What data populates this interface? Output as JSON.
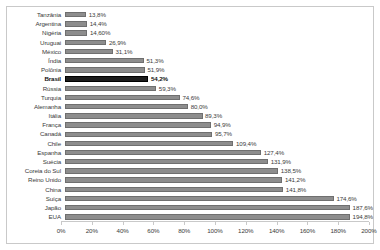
{
  "chart_data": {
    "type": "bar",
    "orientation": "horizontal",
    "title": "",
    "xlabel": "",
    "ylabel": "",
    "xlim": [
      0,
      200
    ],
    "grid": false,
    "legend": null,
    "highlight_category": "Brasil",
    "colors": {
      "bar": "#8d8d8d",
      "bar_highlight": "#1c1c1c",
      "border": "#c9c9c9",
      "text": "#3b3b3b"
    },
    "value_suffix": "%",
    "decimal_separator": ",",
    "xticks": [
      "0%",
      "20%",
      "40%",
      "60%",
      "80%",
      "100%",
      "120%",
      "140%",
      "160%",
      "180%",
      "200%"
    ],
    "xtick_values": [
      0,
      20,
      40,
      60,
      80,
      100,
      120,
      140,
      160,
      180,
      200
    ],
    "categories": [
      "Tanzânia",
      "Argentina",
      "Nigéria",
      "Uruguai",
      "México",
      "Índia",
      "Polônia",
      "Brasil",
      "Rússia",
      "Turquia",
      "Alemanha",
      "Itália",
      "França",
      "Canadá",
      "Chile",
      "Espanha",
      "Suécia",
      "Coreia do Sul",
      "Reino Unido",
      "China",
      "Suíça",
      "Japão",
      "EUA"
    ],
    "values": [
      13.8,
      14.4,
      14.6,
      26.9,
      31.1,
      51.3,
      51.9,
      54.2,
      59.3,
      74.6,
      80.0,
      89.3,
      94.9,
      95.7,
      109.4,
      127.4,
      131.9,
      138.5,
      141.2,
      141.8,
      174.6,
      187.6,
      194.8
    ],
    "data_labels": [
      "13,8%",
      "14,4%",
      "14,60%",
      "26,9%",
      "31,1%",
      "51,3%",
      "51,9%",
      "54,2%",
      "59,3%",
      "74,6%",
      "80,0%",
      "89,3%",
      "94,9%",
      "95,7%",
      "109,4%",
      "127,4%",
      "131,9%",
      "138,5%",
      "141,2%",
      "141,8%",
      "174,6%",
      "187,6%",
      "194,8%"
    ]
  }
}
